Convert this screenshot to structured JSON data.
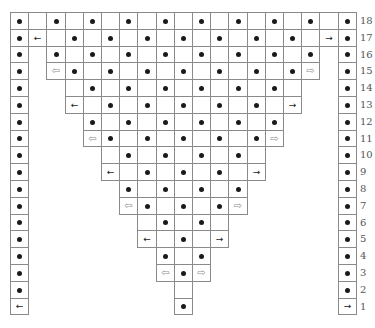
{
  "diagram": {
    "title": "",
    "grid": {
      "columns": 19,
      "rows": 18,
      "left": 10,
      "top": 12,
      "cell_width": 18.2,
      "cell_height": 16.8
    },
    "colors": {
      "border": "#8a8a8a",
      "dot": "#1a1a1a",
      "hollow_arrow": "#8c8c8c",
      "row_number": "#555555"
    },
    "symbols": {
      "dot": "dot",
      "arrow-left": "←",
      "arrow-right": "→",
      "hollow-arrow-left": "⇦",
      "hollow-arrow-right": "⇨",
      "empty": ""
    },
    "rows": [
      {
        "number": "18",
        "cells": [
          [
            0,
            "dot"
          ],
          [
            1,
            "empty"
          ],
          [
            2,
            "dot"
          ],
          [
            3,
            "empty"
          ],
          [
            4,
            "dot"
          ],
          [
            5,
            "empty"
          ],
          [
            6,
            "dot"
          ],
          [
            7,
            "empty"
          ],
          [
            8,
            "dot"
          ],
          [
            9,
            "empty"
          ],
          [
            10,
            "dot"
          ],
          [
            11,
            "empty"
          ],
          [
            12,
            "dot"
          ],
          [
            13,
            "empty"
          ],
          [
            14,
            "dot"
          ],
          [
            15,
            "empty"
          ],
          [
            16,
            "dot"
          ],
          [
            17,
            "empty"
          ],
          [
            18,
            "dot"
          ]
        ]
      },
      {
        "number": "17",
        "cells": [
          [
            0,
            "dot"
          ],
          [
            1,
            "arrow-left"
          ],
          [
            2,
            "empty"
          ],
          [
            3,
            "dot"
          ],
          [
            4,
            "empty"
          ],
          [
            5,
            "dot"
          ],
          [
            6,
            "empty"
          ],
          [
            7,
            "dot"
          ],
          [
            8,
            "empty"
          ],
          [
            9,
            "dot"
          ],
          [
            10,
            "empty"
          ],
          [
            11,
            "dot"
          ],
          [
            12,
            "empty"
          ],
          [
            13,
            "dot"
          ],
          [
            14,
            "empty"
          ],
          [
            15,
            "dot"
          ],
          [
            16,
            "empty"
          ],
          [
            17,
            "arrow-right"
          ],
          [
            18,
            "dot"
          ]
        ]
      },
      {
        "number": "16",
        "cells": [
          [
            0,
            "dot"
          ],
          [
            2,
            "dot"
          ],
          [
            3,
            "empty"
          ],
          [
            4,
            "dot"
          ],
          [
            5,
            "empty"
          ],
          [
            6,
            "dot"
          ],
          [
            7,
            "empty"
          ],
          [
            8,
            "dot"
          ],
          [
            9,
            "empty"
          ],
          [
            10,
            "dot"
          ],
          [
            11,
            "empty"
          ],
          [
            12,
            "dot"
          ],
          [
            13,
            "empty"
          ],
          [
            14,
            "dot"
          ],
          [
            15,
            "empty"
          ],
          [
            16,
            "dot"
          ],
          [
            18,
            "dot"
          ]
        ]
      },
      {
        "number": "15",
        "cells": [
          [
            0,
            "dot"
          ],
          [
            2,
            "hollow-arrow-left"
          ],
          [
            3,
            "dot"
          ],
          [
            4,
            "empty"
          ],
          [
            5,
            "dot"
          ],
          [
            6,
            "empty"
          ],
          [
            7,
            "dot"
          ],
          [
            8,
            "empty"
          ],
          [
            9,
            "dot"
          ],
          [
            10,
            "empty"
          ],
          [
            11,
            "dot"
          ],
          [
            12,
            "empty"
          ],
          [
            13,
            "dot"
          ],
          [
            14,
            "empty"
          ],
          [
            15,
            "dot"
          ],
          [
            16,
            "hollow-arrow-right"
          ],
          [
            18,
            "dot"
          ]
        ]
      },
      {
        "number": "14",
        "cells": [
          [
            0,
            "dot"
          ],
          [
            3,
            "empty"
          ],
          [
            4,
            "dot"
          ],
          [
            5,
            "empty"
          ],
          [
            6,
            "dot"
          ],
          [
            7,
            "empty"
          ],
          [
            8,
            "dot"
          ],
          [
            9,
            "empty"
          ],
          [
            10,
            "dot"
          ],
          [
            11,
            "empty"
          ],
          [
            12,
            "dot"
          ],
          [
            13,
            "empty"
          ],
          [
            14,
            "dot"
          ],
          [
            15,
            "empty"
          ],
          [
            18,
            "dot"
          ]
        ]
      },
      {
        "number": "13",
        "cells": [
          [
            0,
            "dot"
          ],
          [
            3,
            "arrow-left"
          ],
          [
            4,
            "empty"
          ],
          [
            5,
            "dot"
          ],
          [
            6,
            "empty"
          ],
          [
            7,
            "dot"
          ],
          [
            8,
            "empty"
          ],
          [
            9,
            "dot"
          ],
          [
            10,
            "empty"
          ],
          [
            11,
            "dot"
          ],
          [
            12,
            "empty"
          ],
          [
            13,
            "dot"
          ],
          [
            14,
            "empty"
          ],
          [
            15,
            "arrow-right"
          ],
          [
            18,
            "dot"
          ]
        ]
      },
      {
        "number": "12",
        "cells": [
          [
            0,
            "dot"
          ],
          [
            4,
            "dot"
          ],
          [
            5,
            "empty"
          ],
          [
            6,
            "dot"
          ],
          [
            7,
            "empty"
          ],
          [
            8,
            "dot"
          ],
          [
            9,
            "empty"
          ],
          [
            10,
            "dot"
          ],
          [
            11,
            "empty"
          ],
          [
            12,
            "dot"
          ],
          [
            13,
            "empty"
          ],
          [
            14,
            "dot"
          ],
          [
            18,
            "dot"
          ]
        ]
      },
      {
        "number": "11",
        "cells": [
          [
            0,
            "dot"
          ],
          [
            4,
            "hollow-arrow-left"
          ],
          [
            5,
            "dot"
          ],
          [
            6,
            "empty"
          ],
          [
            7,
            "dot"
          ],
          [
            8,
            "empty"
          ],
          [
            9,
            "dot"
          ],
          [
            10,
            "empty"
          ],
          [
            11,
            "dot"
          ],
          [
            12,
            "empty"
          ],
          [
            13,
            "dot"
          ],
          [
            14,
            "hollow-arrow-right"
          ],
          [
            18,
            "dot"
          ]
        ]
      },
      {
        "number": "10",
        "cells": [
          [
            0,
            "dot"
          ],
          [
            5,
            "empty"
          ],
          [
            6,
            "dot"
          ],
          [
            7,
            "empty"
          ],
          [
            8,
            "dot"
          ],
          [
            9,
            "empty"
          ],
          [
            10,
            "dot"
          ],
          [
            11,
            "empty"
          ],
          [
            12,
            "dot"
          ],
          [
            13,
            "empty"
          ],
          [
            18,
            "dot"
          ]
        ]
      },
      {
        "number": "9",
        "cells": [
          [
            0,
            "dot"
          ],
          [
            5,
            "arrow-left"
          ],
          [
            6,
            "empty"
          ],
          [
            7,
            "dot"
          ],
          [
            8,
            "empty"
          ],
          [
            9,
            "dot"
          ],
          [
            10,
            "empty"
          ],
          [
            11,
            "dot"
          ],
          [
            12,
            "empty"
          ],
          [
            13,
            "arrow-right"
          ],
          [
            18,
            "dot"
          ]
        ]
      },
      {
        "number": "8",
        "cells": [
          [
            0,
            "dot"
          ],
          [
            6,
            "dot"
          ],
          [
            7,
            "empty"
          ],
          [
            8,
            "dot"
          ],
          [
            9,
            "empty"
          ],
          [
            10,
            "dot"
          ],
          [
            11,
            "empty"
          ],
          [
            12,
            "dot"
          ],
          [
            18,
            "dot"
          ]
        ]
      },
      {
        "number": "7",
        "cells": [
          [
            0,
            "dot"
          ],
          [
            6,
            "hollow-arrow-left"
          ],
          [
            7,
            "dot"
          ],
          [
            8,
            "empty"
          ],
          [
            9,
            "dot"
          ],
          [
            10,
            "empty"
          ],
          [
            11,
            "dot"
          ],
          [
            12,
            "hollow-arrow-right"
          ],
          [
            18,
            "dot"
          ]
        ]
      },
      {
        "number": "6",
        "cells": [
          [
            0,
            "dot"
          ],
          [
            7,
            "empty"
          ],
          [
            8,
            "dot"
          ],
          [
            9,
            "empty"
          ],
          [
            10,
            "dot"
          ],
          [
            11,
            "empty"
          ],
          [
            18,
            "dot"
          ]
        ]
      },
      {
        "number": "5",
        "cells": [
          [
            0,
            "dot"
          ],
          [
            7,
            "arrow-left"
          ],
          [
            8,
            "empty"
          ],
          [
            9,
            "dot"
          ],
          [
            10,
            "empty"
          ],
          [
            11,
            "arrow-right"
          ],
          [
            18,
            "dot"
          ]
        ]
      },
      {
        "number": "4",
        "cells": [
          [
            0,
            "dot"
          ],
          [
            8,
            "dot"
          ],
          [
            9,
            "empty"
          ],
          [
            10,
            "dot"
          ],
          [
            18,
            "dot"
          ]
        ]
      },
      {
        "number": "3",
        "cells": [
          [
            0,
            "dot"
          ],
          [
            8,
            "hollow-arrow-left"
          ],
          [
            9,
            "dot"
          ],
          [
            10,
            "hollow-arrow-right"
          ],
          [
            18,
            "dot"
          ]
        ]
      },
      {
        "number": "2",
        "cells": [
          [
            0,
            "dot"
          ],
          [
            9,
            "empty"
          ],
          [
            18,
            "dot"
          ]
        ]
      },
      {
        "number": "1",
        "cells": [
          [
            0,
            "arrow-left"
          ],
          [
            9,
            "dot"
          ],
          [
            18,
            "arrow-right"
          ]
        ]
      }
    ]
  }
}
